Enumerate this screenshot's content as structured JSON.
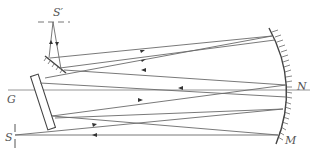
{
  "diagram": {
    "type": "optical-spectrometer-schematic",
    "labels": {
      "source_image": "S′",
      "grating": "G",
      "source": "S",
      "mirror_center": "N",
      "mirror": "M"
    },
    "colors": {
      "ray": "#6a6a6a",
      "mirror": "#444444",
      "label": "#555555"
    }
  }
}
